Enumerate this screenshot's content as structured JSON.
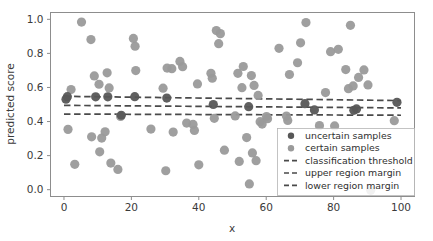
{
  "chart_data": {
    "type": "scatter",
    "title": "",
    "xlabel": "x",
    "ylabel": "predicted score",
    "xlim": [
      -4,
      104
    ],
    "ylim": [
      -0.04,
      1.04
    ],
    "xticks": [
      0,
      20,
      40,
      60,
      80,
      100
    ],
    "xtick_labels": [
      "0",
      "20",
      "40",
      "60",
      "80",
      "100"
    ],
    "yticks": [
      0.0,
      0.2,
      0.4,
      0.6,
      0.8,
      1.0
    ],
    "ytick_labels": [
      "0.0",
      "0.2",
      "0.4",
      "0.6",
      "0.8",
      "1.0"
    ],
    "grid": false,
    "legend_position": "lower right",
    "colors": {
      "uncertain_marker": "#575757",
      "certain_marker": "#9a9a9a",
      "threshold_line": "#4a4a4a",
      "upper_margin_line": "#4a4a4a",
      "lower_margin_line": "#4a4a4a",
      "axes_frame": "#8d8d8d",
      "background": "#ffffff"
    },
    "series": [
      {
        "name": "uncertain samples",
        "marker": "circle",
        "color": "#575757",
        "size": 4.6,
        "points": [
          [
            0.6,
            0.531
          ],
          [
            1.0,
            0.546
          ],
          [
            9.4,
            0.545
          ],
          [
            13.0,
            0.545
          ],
          [
            21.0,
            0.546
          ],
          [
            30.5,
            0.538
          ],
          [
            44.3,
            0.5
          ],
          [
            54.8,
            0.487
          ],
          [
            71.5,
            0.505
          ],
          [
            74.3,
            0.468
          ],
          [
            86.0,
            0.466
          ],
          [
            86.8,
            0.474
          ],
          [
            98.8,
            0.513
          ],
          [
            17.0,
            0.437
          ]
        ]
      },
      {
        "name": "certain samples",
        "marker": "circle",
        "color": "#9a9a9a",
        "size": 4.6,
        "points": [
          [
            1.2,
            0.354
          ],
          [
            2.1,
            0.588
          ],
          [
            3.2,
            0.149
          ],
          [
            5.2,
            0.984
          ],
          [
            8.0,
            0.881
          ],
          [
            8.2,
            0.31
          ],
          [
            9.0,
            0.668
          ],
          [
            10.4,
            0.619
          ],
          [
            10.6,
            0.222
          ],
          [
            11.2,
            0.303
          ],
          [
            12.2,
            0.34
          ],
          [
            12.8,
            0.686
          ],
          [
            13.4,
            0.597
          ],
          [
            13.9,
            0.156
          ],
          [
            16.0,
            0.119
          ],
          [
            16.8,
            0.43
          ],
          [
            20.6,
            0.888
          ],
          [
            21.1,
            0.842
          ],
          [
            21.3,
            0.699
          ],
          [
            25.8,
            0.356
          ],
          [
            29.4,
            0.596
          ],
          [
            30.2,
            0.111
          ],
          [
            30.6,
            0.714
          ],
          [
            32.0,
            0.71
          ],
          [
            32.4,
            0.338
          ],
          [
            34.4,
            0.753
          ],
          [
            35.2,
            0.722
          ],
          [
            36.4,
            0.391
          ],
          [
            38.3,
            0.383
          ],
          [
            38.7,
            0.348
          ],
          [
            39.6,
            0.621
          ],
          [
            40.0,
            0.146
          ],
          [
            43.6,
            0.683
          ],
          [
            44.0,
            0.654
          ],
          [
            44.6,
            0.419
          ],
          [
            45.2,
            0.934
          ],
          [
            45.9,
            0.857
          ],
          [
            46.4,
            0.916
          ],
          [
            47.6,
            0.232
          ],
          [
            51.6,
            0.683
          ],
          [
            52.0,
            0.166
          ],
          [
            52.8,
            0.599
          ],
          [
            53.2,
            0.723
          ],
          [
            54.2,
            0.306
          ],
          [
            55.0,
            0.034
          ],
          [
            55.6,
            0.67
          ],
          [
            55.9,
            0.216
          ],
          [
            56.4,
            0.612
          ],
          [
            57.0,
            0.17
          ],
          [
            57.6,
            0.553
          ],
          [
            58.2,
            0.399
          ],
          [
            58.8,
            0.385
          ],
          [
            60.1,
            0.429
          ],
          [
            60.4,
            0.417
          ],
          [
            63.8,
            0.83
          ],
          [
            66.4,
            0.406
          ],
          [
            66.9,
            0.676
          ],
          [
            69.3,
            0.745
          ],
          [
            70.2,
            0.862
          ],
          [
            71.8,
            0.981
          ],
          [
            75.8,
            0.376
          ],
          [
            77.6,
            0.57
          ],
          [
            79.1,
            0.81
          ],
          [
            80.3,
            0.374
          ],
          [
            81.4,
            0.824
          ],
          [
            83.6,
            0.705
          ],
          [
            84.4,
            0.593
          ],
          [
            85.0,
            0.965
          ],
          [
            85.8,
            0.609
          ],
          [
            87.4,
            0.659
          ],
          [
            89.0,
            0.703
          ],
          [
            90.2,
            0.615
          ],
          [
            91.0,
            -0.004
          ],
          [
            98.0,
            0.405
          ],
          [
            66.0,
            0.432
          ],
          [
            50.8,
            0.433
          ]
        ]
      }
    ],
    "reference_lines": [
      {
        "name": "upper region margin",
        "style": "dashed",
        "color": "#4a4a4a",
        "x_start": 0,
        "x_end": 100,
        "y_start": 0.548,
        "y_end": 0.523
      },
      {
        "name": "classification threshold",
        "style": "dashed",
        "color": "#4a4a4a",
        "x_start": 0,
        "x_end": 100,
        "y_start": 0.495,
        "y_end": 0.48
      },
      {
        "name": "lower region margin",
        "style": "dashed",
        "color": "#4a4a4a",
        "x_start": 0,
        "x_end": 100,
        "y_start": 0.444,
        "y_end": 0.437
      }
    ],
    "legend_entries": [
      {
        "label": "uncertain samples",
        "type": "marker",
        "color": "#575757"
      },
      {
        "label": "certain samples",
        "type": "marker",
        "color": "#9a9a9a"
      },
      {
        "label": "classification threshold",
        "type": "line",
        "color": "#4a4a4a"
      },
      {
        "label": "upper region margin",
        "type": "line",
        "color": "#4a4a4a"
      },
      {
        "label": "lower region margin",
        "type": "line",
        "color": "#4a4a4a"
      }
    ]
  }
}
